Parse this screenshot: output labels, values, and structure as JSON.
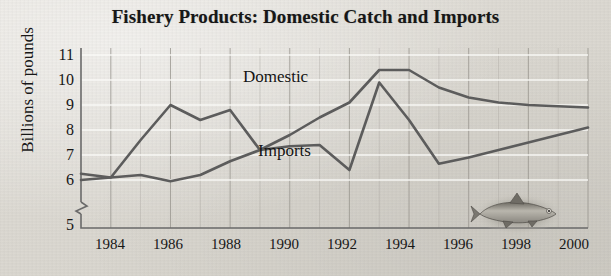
{
  "chart_data": {
    "type": "line",
    "title": "Fishery Products: Domestic Catch and Imports",
    "xlabel": "",
    "ylabel": "Billions of pounds",
    "ylim": [
      5,
      11
    ],
    "xlim": [
      1983,
      2000
    ],
    "grid": true,
    "y_axis_break": true,
    "y_ticks": [
      5,
      6,
      7,
      8,
      9,
      10,
      11
    ],
    "x_ticks": [
      1984,
      1986,
      1988,
      1990,
      1992,
      1994,
      1996,
      1998,
      2000
    ],
    "x_minor_ticks": [
      1983,
      1985,
      1987,
      1989,
      1991,
      1993,
      1995,
      1997,
      1999
    ],
    "legend_position": "inline-annotation",
    "line_color": "#5c5c5c",
    "x": [
      1983,
      1984,
      1985,
      1986,
      1987,
      1988,
      1989,
      1990,
      1991,
      1992,
      1993,
      1994,
      1995,
      1996,
      1997,
      1998,
      1999,
      2000
    ],
    "series": [
      {
        "name": "Domestic",
        "values": [
          6.0,
          6.1,
          7.6,
          9.0,
          8.4,
          8.8,
          7.2,
          7.8,
          8.5,
          9.1,
          10.4,
          10.4,
          9.7,
          9.3,
          9.1,
          9.0,
          8.95,
          8.9
        ]
      },
      {
        "name": "Imports",
        "values": [
          6.25,
          6.1,
          6.2,
          5.95,
          6.2,
          6.75,
          7.2,
          7.35,
          7.4,
          6.4,
          9.9,
          8.4,
          6.65,
          6.9,
          7.2,
          7.5,
          7.8,
          8.1
        ]
      }
    ],
    "annotations": [
      {
        "text": "Domestic",
        "series": "Domestic"
      },
      {
        "text": "Imports",
        "series": "Imports"
      }
    ],
    "decorations": [
      {
        "name": "fish-illustration",
        "description": "shaded photo of a fish"
      }
    ]
  }
}
